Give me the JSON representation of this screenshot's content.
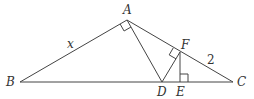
{
  "diagram": {
    "points": {
      "A": {
        "label": "A",
        "x": 127,
        "y": 20
      },
      "B": {
        "label": "B",
        "x": 20,
        "y": 82
      },
      "C": {
        "label": "C",
        "x": 233,
        "y": 82
      },
      "D": {
        "label": "D",
        "x": 162,
        "y": 82
      },
      "E": {
        "label": "E",
        "x": 180,
        "y": 82
      },
      "F": {
        "label": "F",
        "x": 180,
        "y": 52
      }
    },
    "segment_labels": {
      "AB": "x",
      "FC": "2"
    },
    "right_angles": [
      "BAD",
      "DFC",
      "FEC"
    ],
    "stroke_color": "#444444",
    "label_color": "#333333"
  }
}
